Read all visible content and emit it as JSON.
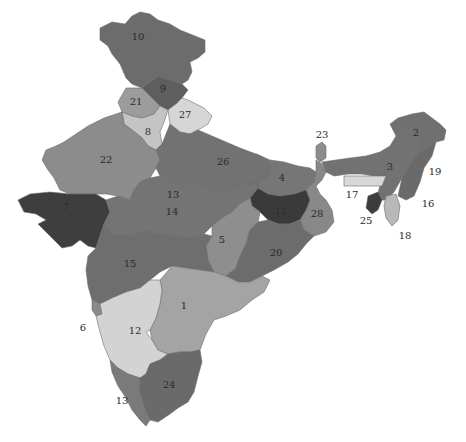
{
  "map": {
    "title": "",
    "shades": {
      "darkest": "#3c3c3c",
      "dark": "#6e6e6e",
      "medium": "#8a8a8a",
      "light": "#a9a9a9",
      "lightest": "#d6d6d6"
    },
    "regions": [
      {
        "id": "1",
        "label": "1",
        "shade": "#a4a4a4"
      },
      {
        "id": "2",
        "label": "2",
        "shade": "#707070"
      },
      {
        "id": "3",
        "label": "3",
        "shade": "#727272"
      },
      {
        "id": "4",
        "label": "4",
        "shade": "#767676"
      },
      {
        "id": "5",
        "label": "5",
        "shade": "#8e8e8e"
      },
      {
        "id": "6",
        "label": "6",
        "shade": "#8a8a8a"
      },
      {
        "id": "7",
        "label": "7",
        "shade": "#3e3e3e"
      },
      {
        "id": "8",
        "label": "8",
        "shade": "#c4c4c4"
      },
      {
        "id": "9",
        "label": "9",
        "shade": "#5e5e5e"
      },
      {
        "id": "10",
        "label": "10",
        "shade": "#6c6c6c"
      },
      {
        "id": "11",
        "label": "11",
        "shade": "#3a3a3a"
      },
      {
        "id": "12",
        "label": "12",
        "shade": "#d3d3d3"
      },
      {
        "id": "13",
        "label": "13",
        "shade": "#7a7a7a"
      },
      {
        "id": "14",
        "label": "14",
        "shade": "#747474"
      },
      {
        "id": "15",
        "label": "15",
        "shade": "#6e6e6e"
      },
      {
        "id": "16",
        "label": "16",
        "shade": "#7a7a7a"
      },
      {
        "id": "17",
        "label": "17",
        "shade": "#d8d8d8"
      },
      {
        "id": "18",
        "label": "18",
        "shade": "#b8b8b8"
      },
      {
        "id": "19",
        "label": "19",
        "shade": "#6a6a6a"
      },
      {
        "id": "20",
        "label": "20",
        "shade": "#6c6c6c"
      },
      {
        "id": "21",
        "label": "21",
        "shade": "#9c9c9c"
      },
      {
        "id": "22",
        "label": "22",
        "shade": "#8c8c8c"
      },
      {
        "id": "23",
        "label": "23",
        "shade": "#8c8c8c"
      },
      {
        "id": "24",
        "label": "24",
        "shade": "#6a6a6a"
      },
      {
        "id": "25",
        "label": "25",
        "shade": "#3c3c3c"
      },
      {
        "id": "26",
        "label": "26",
        "shade": "#727272"
      },
      {
        "id": "27",
        "label": "27",
        "shade": "#d6d6d6"
      },
      {
        "id": "28",
        "label": "28",
        "shade": "#888888"
      }
    ],
    "labels": [
      {
        "text": "10",
        "x": 138,
        "y": 37
      },
      {
        "text": "9",
        "x": 163,
        "y": 89
      },
      {
        "text": "21",
        "x": 136,
        "y": 102
      },
      {
        "text": "27",
        "x": 185,
        "y": 115
      },
      {
        "text": "8",
        "x": 148,
        "y": 132
      },
      {
        "text": "22",
        "x": 106,
        "y": 160
      },
      {
        "text": "26",
        "x": 223,
        "y": 162
      },
      {
        "text": "23",
        "x": 322,
        "y": 135
      },
      {
        "text": "2",
        "x": 416,
        "y": 133
      },
      {
        "text": "3",
        "x": 390,
        "y": 167
      },
      {
        "text": "19",
        "x": 435,
        "y": 172
      },
      {
        "text": "4",
        "x": 282,
        "y": 178
      },
      {
        "text": "17",
        "x": 352,
        "y": 195
      },
      {
        "text": "13",
        "x": 173,
        "y": 195
      },
      {
        "text": "7",
        "x": 66,
        "y": 207
      },
      {
        "text": "14",
        "x": 172,
        "y": 212
      },
      {
        "text": "11",
        "x": 281,
        "y": 211
      },
      {
        "text": "28",
        "x": 317,
        "y": 214
      },
      {
        "text": "16",
        "x": 428,
        "y": 204
      },
      {
        "text": "25",
        "x": 366,
        "y": 221
      },
      {
        "text": "18",
        "x": 405,
        "y": 236
      },
      {
        "text": "5",
        "x": 222,
        "y": 240
      },
      {
        "text": "15",
        "x": 130,
        "y": 264
      },
      {
        "text": "20",
        "x": 276,
        "y": 253
      },
      {
        "text": "1",
        "x": 184,
        "y": 306
      },
      {
        "text": "6",
        "x": 83,
        "y": 328
      },
      {
        "text": "12",
        "x": 135,
        "y": 331
      },
      {
        "text": "24",
        "x": 169,
        "y": 385
      },
      {
        "text": "13",
        "x": 122,
        "y": 401
      }
    ]
  }
}
